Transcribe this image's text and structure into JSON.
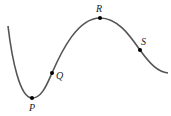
{
  "diagram": {
    "curve_color": "#555555",
    "point_color": "#000000",
    "points": [
      {
        "label": "P",
        "role": "local minimum"
      },
      {
        "label": "Q",
        "role": "point on increasing part"
      },
      {
        "label": "R",
        "role": "local maximum"
      },
      {
        "label": "S",
        "role": "point on decreasing part"
      }
    ]
  }
}
